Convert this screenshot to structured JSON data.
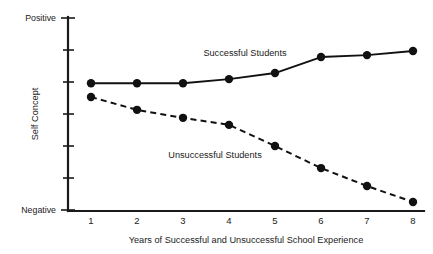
{
  "chart_data": {
    "type": "line",
    "title": "",
    "xlabel": "Years of Successful and Unsuccessful School Experience",
    "ylabel": "Self Concept",
    "x": [
      1,
      2,
      3,
      4,
      5,
      6,
      7,
      8
    ],
    "xticklabels": [
      "1",
      "2",
      "3",
      "4",
      "5",
      "6",
      "7",
      "8"
    ],
    "xlim": [
      1,
      8
    ],
    "ylim": [
      0,
      6
    ],
    "yticklabels": [
      "Negative",
      "",
      "",
      "",
      "",
      "",
      "Positive"
    ],
    "y_axis_top_label": "Positive",
    "y_axis_bottom_label": "Negative",
    "y_tick_count": 7,
    "grid": false,
    "legend_position": "inline-annotations",
    "series": [
      {
        "name": "Successful Students",
        "style": "solid",
        "marker": "filled-circle",
        "color": "#111111",
        "values": [
          3.96,
          3.96,
          3.96,
          4.09,
          4.28,
          4.78,
          4.84,
          4.97
        ]
      },
      {
        "name": "Unsuccessful Students",
        "style": "dashed",
        "marker": "filled-circle",
        "color": "#111111",
        "values": [
          3.53,
          3.13,
          2.88,
          2.66,
          2.0,
          1.31,
          0.75,
          0.25
        ]
      }
    ],
    "annotations": [
      {
        "text": "Successful Students",
        "x": 3.55,
        "y": 5.0
      },
      {
        "text": "Unsuccessful Students",
        "x": 3.0,
        "y": 1.85
      }
    ]
  },
  "colors": {
    "ink": "#111111",
    "axis": "#1a1a1a",
    "background": "#ffffff"
  }
}
